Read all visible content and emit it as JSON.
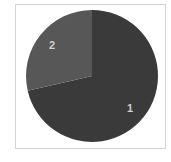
{
  "chart_data": {
    "type": "pie",
    "title": "",
    "categories": [
      "1",
      "2"
    ],
    "values": [
      71.4,
      28.6
    ],
    "colors": [
      "#3a3a3a",
      "#575757"
    ],
    "start_angle_deg": 0,
    "direction": "clockwise",
    "labels_inside": true,
    "legend": false
  },
  "labels": {
    "slice1": "1",
    "slice2": "2"
  }
}
